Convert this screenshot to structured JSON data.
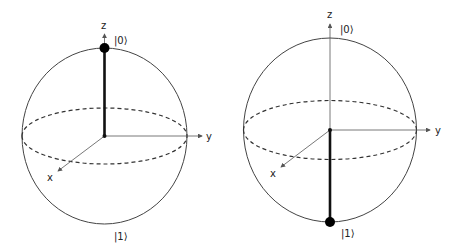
{
  "colors": {
    "stroke": "#333333",
    "axis": "#555555",
    "vector": "#111111"
  },
  "spheres": [
    {
      "name": "bloch-sphere-state-0",
      "state": "|0⟩",
      "labels": {
        "z": "z",
        "y": "y",
        "x": "x",
        "ket0": "|0⟩",
        "ket1": "|1⟩"
      }
    },
    {
      "name": "bloch-sphere-state-1",
      "state": "|1⟩",
      "labels": {
        "z": "z",
        "y": "y",
        "x": "x",
        "ket0": "|0⟩",
        "ket1": "|1⟩"
      }
    }
  ]
}
